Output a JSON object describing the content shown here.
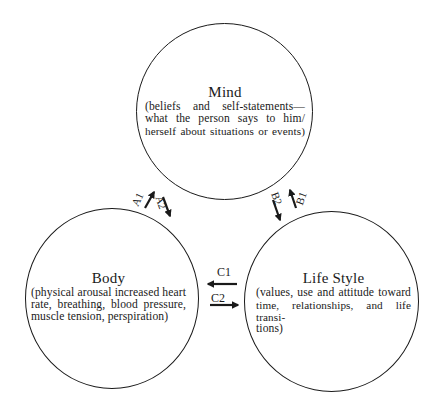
{
  "diagram": {
    "nodes": {
      "mind": {
        "title": "Mind",
        "description": "(beliefs and self-statements—what the person says to him/herself about situations or events)",
        "lines": [
          "(beliefs and self-statements—",
          "what the person says to him/",
          "herself about situations or events)"
        ]
      },
      "body": {
        "title": "Body",
        "description": "(physical arousal increased heart rate, breathing, blood pressure, muscle tension, perspiration)",
        "lines": [
          "(physical arousal increased heart",
          "rate, breathing, blood pressure,",
          "muscle tension, perspiration)"
        ]
      },
      "lifestyle": {
        "title": "Life Style",
        "description": "(values, use and attitude toward time, relationships, and life transitions)",
        "lines": [
          "(values, use and attitude toward",
          "time, relationships, and life transi-",
          "tions)"
        ]
      }
    },
    "edges": [
      {
        "id": "A1",
        "label": "A1",
        "from": "Body",
        "to": "Mind"
      },
      {
        "id": "A2",
        "label": "A2",
        "from": "Mind",
        "to": "Body"
      },
      {
        "id": "B1",
        "label": "B1",
        "from": "Life Style",
        "to": "Mind"
      },
      {
        "id": "B2",
        "label": "B2",
        "from": "Mind",
        "to": "Life Style"
      },
      {
        "id": "C1",
        "label": "C1",
        "from": "Life Style",
        "to": "Body"
      },
      {
        "id": "C2",
        "label": "C2",
        "from": "Body",
        "to": "Life Style"
      }
    ],
    "colors": {
      "ink": "#1a1a1a",
      "background": "#ffffff"
    }
  }
}
